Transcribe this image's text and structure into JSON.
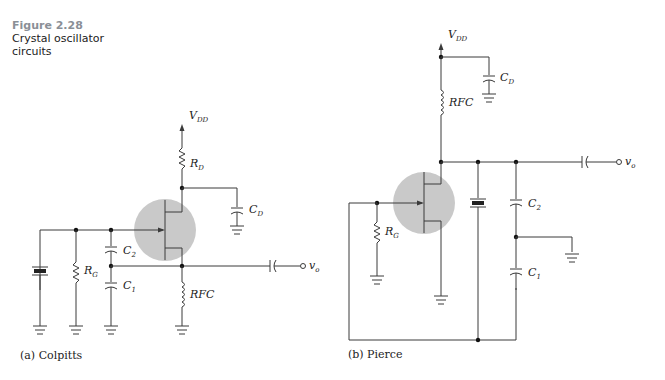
{
  "figure": {
    "number": "Figure 2.28",
    "title_line1": "Crystal oscillator",
    "title_line2": "circuits"
  },
  "colpitts": {
    "caption": "(a)  Colpitts",
    "labels": {
      "vdd": "V",
      "vdd_sub": "DD",
      "rd": "R",
      "rd_sub": "D",
      "cd": "C",
      "cd_sub": "D",
      "rg": "R",
      "rg_sub": "G",
      "c2": "C",
      "c2_sub": "2",
      "c1": "C",
      "c1_sub": "1",
      "rfc": "RFC",
      "vo": "v",
      "vo_sub": "o"
    }
  },
  "pierce": {
    "caption": "(b)  Pierce",
    "labels": {
      "vdd": "V",
      "vdd_sub": "DD",
      "rfc": "RFC",
      "cd": "C",
      "cd_sub": "D",
      "rg": "R",
      "rg_sub": "G",
      "c2": "C",
      "c2_sub": "2",
      "c1": "C",
      "c1_sub": "1",
      "vo": "v",
      "vo_sub": "o"
    }
  },
  "colors": {
    "transistor_halo": "#c9c9c9",
    "figure_number": "#8a8f96"
  }
}
